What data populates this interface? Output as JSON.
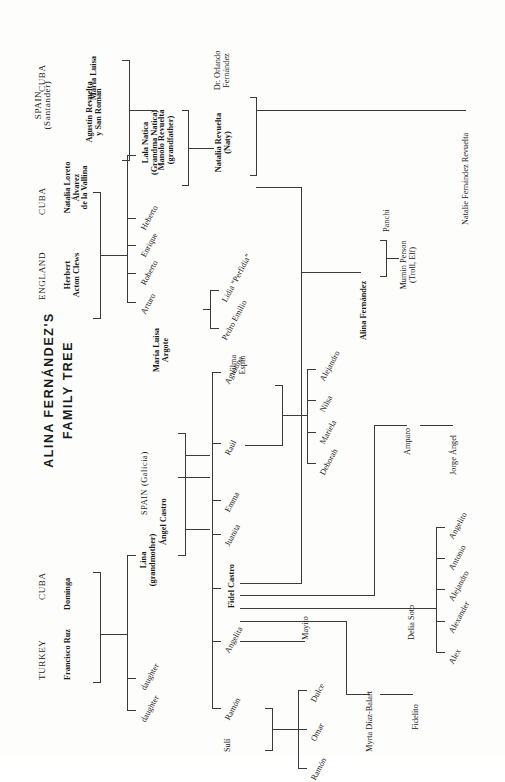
{
  "title": "ALINA FERNÁNDEZ'S\nFAMILY TREE",
  "countries": {
    "england": "ENGLAND",
    "cuba_clews": "CUBA",
    "spain_santander": "SPAIN\n(Santander)",
    "cuba_revuelta": "CUBA",
    "turkey": "TURKEY",
    "cuba_ruz": "CUBA",
    "spain_galicia": "SPAIN (Galicia)"
  },
  "people": {
    "herbert_acton_clews": "Herbert\nActon Clews",
    "natalia_loreto": "Natalia Loreto\nÁlvarez\nde la Vallina",
    "agustin_revuelta": "Agustín Revuelta\ny San Román",
    "maria_luisa": "María Luisa",
    "lala_natica": "Lala Natica\n(Grandma Natica)",
    "heberto": "Heberto",
    "enrique": "Enrique",
    "roberto": "Roberto",
    "arturo": "Arturo",
    "manolo_revuelta": "Manolo Revuelta\n(grandfather)",
    "natalia_revuelta": "Natalia Revuelta\n(Naty)",
    "dr_orlando_fernandez": "Dr. Orlando\nFernández",
    "natalie_fernandez_revuelta": "Natalie Fernández Revuelta",
    "alina_fernandez": "Alina Fernández",
    "panchi": "Panchi",
    "mumin_person": "Mumin Person\n(Troll, Elf)",
    "francisco_ruz": "Francisco Ruz",
    "dominga": "Dominga",
    "lina": "Lina\n(grandmother)",
    "daughter_1": "daughter",
    "daughter_2": "daughter",
    "angel_castro": "Ángel Castro",
    "maria_luisa_argote": "María Luisa\nArgote",
    "lidia_perfidia": "Lidia “Perfidia”",
    "pedro_emilio": "Pedro Emilio",
    "agustina": "Agustina",
    "raul": "Raúl",
    "vilma_espin": "Vilma\nEspín",
    "alejandro_r": "Alejandro",
    "nilsa": "Nilsa",
    "mariela": "Mariela",
    "deborah": "Deborah",
    "emma": "Emma",
    "juanita": "Juanita",
    "fidel_castro": "Fidel Castro",
    "amparo": "Amparo",
    "jorge_angel": "Jorge Ángel",
    "delia_soto": "Delia Soto",
    "angelito": "Angelito",
    "antonio": "Antonio",
    "alejandro_d": "Alejandro",
    "alexander": "Alexander",
    "alex": "Alex",
    "myrta_diaz_balart": "Myrta Díaz-Balart",
    "fidelito": "Fidelito",
    "angelita": "Angelita",
    "mayito": "Mayito",
    "ramon": "Ramón",
    "suli": "Sulí",
    "dulce": "Dulce",
    "omar": "Omar",
    "ramon_child": "Ramón"
  },
  "colors": {
    "ink": "#1a1a1a",
    "rule": "#3a3a3a",
    "paper": "#fdfdfc"
  }
}
